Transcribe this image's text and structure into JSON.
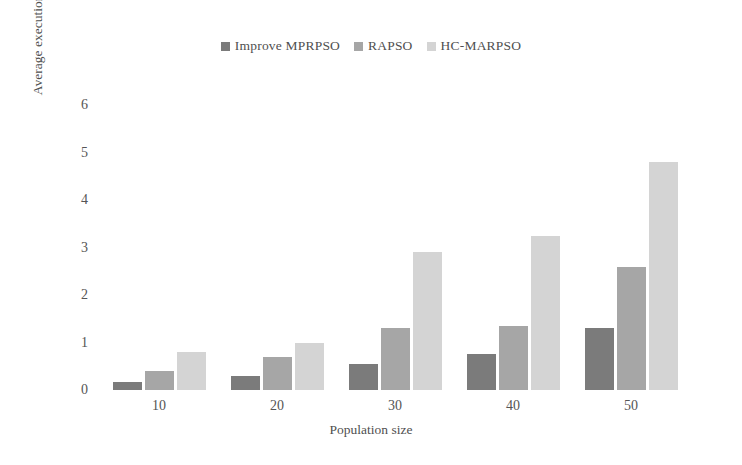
{
  "chart_data": {
    "type": "bar",
    "title": "",
    "subtitle": "",
    "xlabel": "Population size",
    "ylabel": "Average execution tim e/s",
    "categories": [
      "10",
      "20",
      "30",
      "40",
      "50"
    ],
    "series": [
      {
        "name": "Improve MPRPSO",
        "color": "#7b7b7b",
        "values": [
          0.17,
          0.3,
          0.55,
          0.75,
          1.3
        ]
      },
      {
        "name": "RAPSO",
        "color": "#a6a6a6",
        "values": [
          0.4,
          0.7,
          1.3,
          1.35,
          2.6
        ]
      },
      {
        "name": "HC-MARPSO",
        "color": "#d4d4d4",
        "values": [
          0.8,
          1.0,
          2.9,
          3.25,
          4.8
        ]
      }
    ],
    "ylim": [
      0,
      6
    ],
    "yticks": [
      "0",
      "1",
      "2",
      "3",
      "4",
      "5",
      "6"
    ],
    "grid": false,
    "legend_position": "top-center"
  }
}
